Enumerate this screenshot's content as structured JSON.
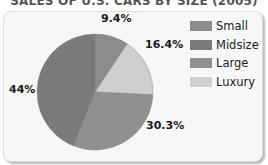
{
  "chart_data": {
    "type": "pie",
    "title": "SALES OF U.S. CARS BY SIZE (2005)",
    "categories": [
      "Small",
      "Luxury",
      "Large",
      "Midsize"
    ],
    "values": [
      9.4,
      16.4,
      30.3,
      44
    ],
    "value_labels": [
      "9.4%",
      "16.4%",
      "30.3%",
      "44%"
    ],
    "colors": {
      "Small": "#8c8c8c",
      "Midsize": "#7a7a7a",
      "Large": "#909090",
      "Luxury": "#cfcfcf"
    },
    "start_angle": "12 o'clock, clockwise",
    "legend": {
      "position": "right",
      "entries": [
        "Small",
        "Midsize",
        "Large",
        "Luxury"
      ]
    }
  },
  "title": "SALES OF U.S. CARS BY SIZE (2005)",
  "labels": {
    "small": "9.4%",
    "luxury": "16.4%",
    "large": "30.3%",
    "midsize": "44%"
  },
  "legend": [
    {
      "label": "Small",
      "color": "#8c8c8c"
    },
    {
      "label": "Midsize",
      "color": "#7a7a7a"
    },
    {
      "label": "Large",
      "color": "#909090"
    },
    {
      "label": "Luxury",
      "color": "#cfcfcf"
    }
  ]
}
